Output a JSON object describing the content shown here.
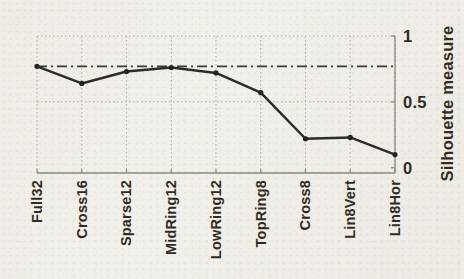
{
  "figure": {
    "kind": "scanned line plot",
    "background_color": "#f2f0ea",
    "line_color": "#2b2b2b",
    "marker_color": "#232323",
    "grid_color": "#b3b0a8",
    "axis_color": "#8d8a82",
    "ref_line_color": "#3a3a3a",
    "text_color": "#2e2a23"
  },
  "chart_data": {
    "type": "line",
    "title": "",
    "xlabel": "",
    "ylabel": "Silhouette measure",
    "categories": [
      "Full32",
      "Cross16",
      "Sparse12",
      "MidRing12",
      "LowRing12",
      "TopRing8",
      "Cross8",
      "Lin8Vert",
      "Lin8Hor"
    ],
    "series": [
      {
        "name": "silhouette-measure",
        "values": [
          0.77,
          0.64,
          0.73,
          0.76,
          0.72,
          0.57,
          0.22,
          0.23,
          0.1
        ]
      }
    ],
    "ref_line": {
      "value": 0.77,
      "style": "dash-dot"
    },
    "yticks": [
      0,
      0.5,
      1
    ],
    "ytick_labels": [
      "0",
      "0.5",
      "1"
    ],
    "ylim": [
      -0.04,
      1
    ],
    "grid": "dotted, vertical at every category, horizontal at 0.5 and 1",
    "legend": "none",
    "x_tick_label_rotation_deg": 90
  }
}
